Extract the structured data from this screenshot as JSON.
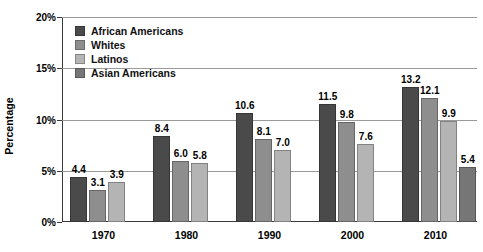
{
  "chart_data": {
    "type": "bar",
    "title": "",
    "subtitle": "",
    "xlabel": "",
    "ylabel": "Percentage",
    "categories": [
      "1970",
      "1980",
      "1990",
      "2000",
      "2010"
    ],
    "ylim": [
      0,
      20
    ],
    "ytick_labels": [
      "0%",
      "5%",
      "10%",
      "15%",
      "20%"
    ],
    "ytick_values": [
      0,
      5,
      10,
      15,
      20
    ],
    "grid": true,
    "legend_position": "inside-top-left",
    "value_labels": true,
    "series": [
      {
        "name": "African Americans",
        "color": "#4a4a4a",
        "values": [
          4.4,
          8.4,
          10.6,
          11.5,
          13.2
        ],
        "labels": [
          "4.4",
          "8.4",
          "10.6",
          "11.5",
          "13.2"
        ]
      },
      {
        "name": "Whites",
        "color": "#8e8e8e",
        "values": [
          3.1,
          6.0,
          8.1,
          9.8,
          12.1
        ],
        "labels": [
          "3.1",
          "6.0",
          "8.1",
          "9.8",
          "12.1"
        ]
      },
      {
        "name": "Latinos",
        "color": "#b4b4b4",
        "values": [
          3.9,
          5.8,
          7.0,
          7.6,
          9.9
        ],
        "labels": [
          "3.9",
          "5.8",
          "7.0",
          "7.6",
          "9.9"
        ]
      },
      {
        "name": "Asian Americans",
        "color": "#767676",
        "values": [
          null,
          null,
          null,
          null,
          5.4
        ],
        "labels": [
          "",
          "",
          "",
          "",
          "5.4"
        ]
      }
    ]
  },
  "legend": {
    "items": [
      {
        "label": "African Americans",
        "color": "#4a4a4a"
      },
      {
        "label": "Whites",
        "color": "#8e8e8e"
      },
      {
        "label": "Latinos",
        "color": "#b4b4b4"
      },
      {
        "label": "Asian Americans",
        "color": "#767676"
      }
    ]
  },
  "axes": {
    "y_title": "Percentage",
    "y_ticks": [
      "20%",
      "15%",
      "10%",
      "5%",
      "0%"
    ],
    "x_ticks": [
      "1970",
      "1980",
      "1990",
      "2000",
      "2010"
    ]
  }
}
